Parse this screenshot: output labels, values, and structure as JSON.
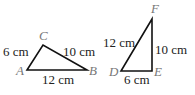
{
  "triangles": [
    {
      "name": "ABC",
      "vertices": {
        "A": "A",
        "B": "B",
        "C": "C"
      },
      "sides": {
        "AC": "6 cm",
        "CB": "10 cm",
        "AB": "12 cm"
      }
    },
    {
      "name": "DEF",
      "vertices": {
        "D": "D",
        "E": "E",
        "F": "F"
      },
      "sides": {
        "DF": "12 cm",
        "EF": "10 cm",
        "DE": "6 cm"
      }
    }
  ]
}
